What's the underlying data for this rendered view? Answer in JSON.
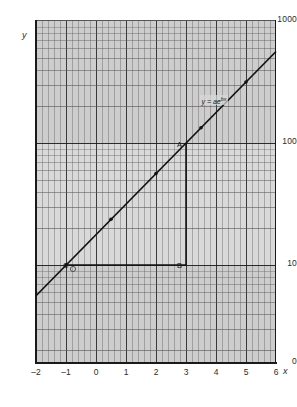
{
  "figure": {
    "background_color": "#ffffff",
    "plot_background_color": "#d9d9d9",
    "line_color": "#111111",
    "grid_color": "#5a5a5a"
  },
  "axes": {
    "x_axis_name": "x",
    "y_axis_name": "y",
    "y_tick_labels": [
      "1000",
      "100",
      "10",
      "0"
    ],
    "x_tick_labels": [
      "–2",
      "–1",
      "0",
      "1",
      "2",
      "3",
      "4",
      "5",
      "6"
    ]
  },
  "annotations": {
    "point_a_label": "A",
    "point_b_label": "B",
    "point_c_label": "C",
    "equation_prefix": "y = ae",
    "equation_exponent": "bx"
  },
  "chart_data": {
    "type": "line",
    "title": "",
    "xlabel": "x",
    "ylabel": "y",
    "xlim": [
      -2,
      6
    ],
    "ylim": [
      1,
      1000
    ],
    "yscale": "log",
    "xscale": "linear",
    "grid": true,
    "legend": false,
    "y_ticks": [
      10,
      100,
      1000
    ],
    "y_tick_labels": [
      "10",
      "100",
      "1000"
    ],
    "x_ticks": [
      -2,
      -1,
      0,
      1,
      2,
      3,
      4,
      5,
      6
    ],
    "x_tick_labels": [
      "–2",
      "–1",
      "0",
      "1",
      "2",
      "3",
      "4",
      "5",
      "6"
    ],
    "series": [
      {
        "name": "y = ae^(bx)",
        "equation": "y = ae^{bx}",
        "x": [
          -2,
          -1,
          0,
          1,
          2,
          3,
          4,
          5,
          6
        ],
        "values": [
          5.6,
          10.0,
          17.8,
          31.6,
          56.2,
          100.0,
          177.8,
          316.2,
          562.3
        ],
        "marker_points": [
          {
            "x": -1,
            "y": 10.0
          },
          {
            "x": 0.5,
            "y": 23.7
          },
          {
            "x": 2,
            "y": 56.2
          },
          {
            "x": 3.5,
            "y": 133.4
          },
          {
            "x": 5,
            "y": 316.2
          }
        ]
      }
    ],
    "annotations": [
      {
        "label": "A",
        "x": 3,
        "y": 100
      },
      {
        "label": "B",
        "x": 3,
        "y": 10
      },
      {
        "label": "C",
        "x": -1,
        "y": 10
      }
    ],
    "construction_lines": [
      {
        "name": "vertical-ab",
        "from": {
          "x": 3,
          "y": 100
        },
        "to": {
          "x": 3,
          "y": 10
        }
      },
      {
        "name": "horizontal-cb",
        "from": {
          "x": -1,
          "y": 10
        },
        "to": {
          "x": 3,
          "y": 10
        }
      }
    ]
  }
}
